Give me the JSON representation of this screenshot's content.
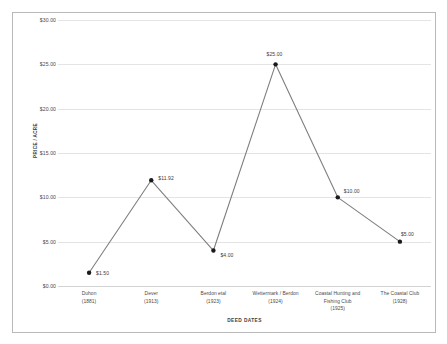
{
  "chart_data": {
    "type": "line",
    "title": "",
    "xlabel": "DEED DATES",
    "ylabel": "PRICE / ACRE",
    "categories": [
      {
        "name": "Duhon",
        "year": "(1881)"
      },
      {
        "name": "Dever",
        "year": "(1913)"
      },
      {
        "name": "Berdon etal",
        "year": "(1923)"
      },
      {
        "name": "Wettermark / Berdon",
        "year": "(1924)"
      },
      {
        "name": "Coastal Hunting and Fishing Club",
        "year": "(1925)"
      },
      {
        "name": "The Coastal Club",
        "year": "(1928)"
      }
    ],
    "category_labels": [
      "Duhon",
      "Dever",
      "Berdon etal",
      "Wettermark / Berdon",
      "Coastal Hunting and Fishing Club",
      "The Coastal Club"
    ],
    "values": [
      1.5,
      11.92,
      4.0,
      25.0,
      10.0,
      5.0
    ],
    "point_labels": [
      "$1.50",
      "$11.92",
      "$4.00",
      "$25.00",
      "$10.00",
      "$5.00"
    ],
    "ylim": [
      0,
      30
    ],
    "ytick_values": [
      0,
      5,
      10,
      15,
      20,
      25,
      30
    ],
    "ytick_labels": [
      "$0.00",
      "$5.00",
      "$10.00",
      "$15.00",
      "$20.00",
      "$25.00",
      "$30.00"
    ],
    "grid": true,
    "legend": "none",
    "series_color": "#7f7f7f",
    "marker_color": "#1a1a1a",
    "gridline_color": "#e4e4e4",
    "frame_color": "#b9b9b9",
    "text_color": "#4a4a4a"
  }
}
